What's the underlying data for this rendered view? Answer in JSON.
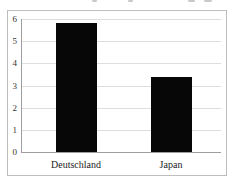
{
  "chart_data": {
    "type": "bar",
    "categories": [
      "Deutschland",
      "Japan"
    ],
    "values": [
      5.8,
      3.4
    ],
    "title": "",
    "xlabel": "",
    "ylabel": "",
    "ylim": [
      0,
      6
    ],
    "ytick_step": 1,
    "ytick_labels": [
      "0",
      "1",
      "2",
      "3",
      "4",
      "5",
      "6"
    ],
    "grid": true,
    "legend": "none",
    "bar_color": "#070707",
    "gridline_color": "#dedede",
    "axis_color": "#9e9e9e",
    "border_color": "#bdbdbd",
    "label_color": "#333333",
    "background_color": "#ffffff"
  }
}
